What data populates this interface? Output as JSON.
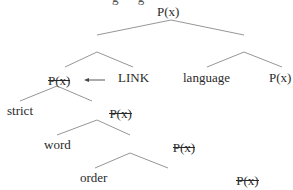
{
  "diagram": {
    "type": "syntax-tree",
    "top_clipped_text": "g g",
    "root": {
      "label": "P(x)",
      "struck": false
    },
    "level1": {
      "left_node": {
        "label": "P(x)",
        "struck": true
      },
      "link": {
        "label": "LINK",
        "arrow": "left-arrow"
      },
      "right_left": {
        "label": "language",
        "struck": false
      },
      "right_right": {
        "label": "P(x)",
        "struck": false
      }
    },
    "level2": {
      "left": {
        "label": "strict"
      },
      "right": {
        "label": "P(x)",
        "struck": true
      }
    },
    "level3": {
      "left": {
        "label": "word"
      },
      "right": {
        "label": "P(x)",
        "struck": true
      }
    },
    "level4": {
      "left": {
        "label": "order"
      },
      "right": {
        "label": "P(x)",
        "struck": true
      }
    },
    "colors": {
      "text": "#2a2a2a",
      "lines": "#8a8a8a",
      "background": "#ffffff"
    }
  }
}
